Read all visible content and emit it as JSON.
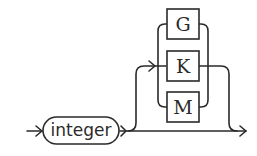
{
  "diagram": {
    "type": "railroad-syntax",
    "nonterminal": {
      "label": "integer"
    },
    "optional_choice": {
      "terminals": [
        {
          "label": "G"
        },
        {
          "label": "K"
        },
        {
          "label": "M"
        }
      ]
    },
    "stroke_color": "#2a2a2a"
  }
}
